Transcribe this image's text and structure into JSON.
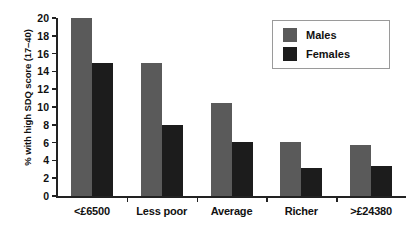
{
  "chart_data": {
    "type": "bar",
    "title": "",
    "subtitle": "",
    "xlabel": "",
    "ylabel": "% with high SDQ score (17–40)",
    "categories": [
      "<£6500",
      "Less poor",
      "Average",
      "Richer",
      ">£24380"
    ],
    "series": [
      {
        "name": "Males",
        "color": "#5a5a5a",
        "values": [
          20.0,
          15.0,
          10.5,
          6.1,
          5.7
        ]
      },
      {
        "name": "Females",
        "color": "#1c1c1c",
        "values": [
          14.9,
          8.0,
          6.1,
          3.2,
          3.4
        ]
      }
    ],
    "ylim": [
      0,
      20
    ],
    "ytick_step": 2,
    "yticks": [
      20,
      18,
      16,
      14,
      12,
      10,
      8,
      6,
      4,
      2,
      0
    ],
    "ytick_labels": [
      "20",
      "18",
      "16",
      "14",
      "12",
      "10",
      "8",
      "6",
      "4",
      "2",
      "0"
    ],
    "grid": false,
    "legend_position": "top-right",
    "legend_entries": [
      "Males",
      "Females"
    ]
  },
  "legend": {
    "males_label": "Males",
    "females_label": "Females"
  },
  "axes": {
    "y_title": "% with high SDQ score (17–40)"
  }
}
